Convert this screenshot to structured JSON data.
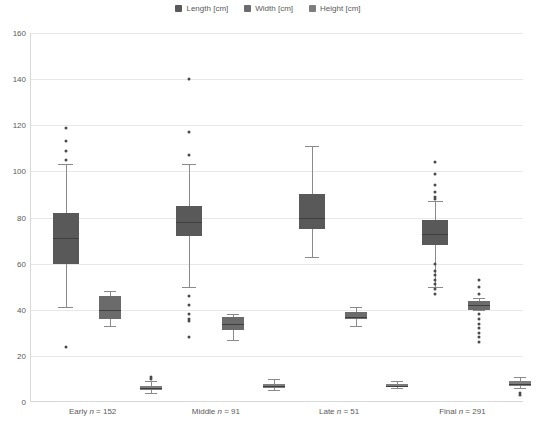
{
  "legend": {
    "position": "top-center",
    "items": [
      {
        "label": "Length [cm]",
        "color": "#595959"
      },
      {
        "label": "Width [cm]",
        "color": "#6b6b6b"
      },
      {
        "label": "Height [cm]",
        "color": "#7d7d7d"
      }
    ]
  },
  "axes": {
    "y": {
      "min": 0,
      "max": 160,
      "step": 20,
      "ticks": [
        "0",
        "20",
        "40",
        "60",
        "80",
        "100",
        "120",
        "140",
        "160"
      ],
      "label": "",
      "grid": true
    },
    "x": {
      "label": "",
      "categories": [
        {
          "name": "Early",
          "n": 152,
          "label": "Early n = 152"
        },
        {
          "name": "Middle",
          "n": 91,
          "label": "Middle n = 91"
        },
        {
          "name": "Late",
          "n": 51,
          "label": "Late n = 51"
        },
        {
          "name": "Final",
          "n": 291,
          "label": "Final n = 291"
        }
      ]
    }
  },
  "chart_data": {
    "type": "box",
    "title": "",
    "xlabel": "",
    "ylabel": "",
    "ylim": [
      0,
      160
    ],
    "grid": true,
    "categories": [
      "Early n = 152",
      "Middle n = 91",
      "Late n = 51",
      "Final n = 291"
    ],
    "series": [
      {
        "name": "Length [cm]",
        "color": "#595959",
        "boxes": [
          {
            "category": "Early n = 152",
            "whisker_low": 41,
            "q1": 60,
            "median": 71,
            "q3": 82,
            "whisker_high": 103,
            "outliers": [
              119,
              113,
              109,
              105,
              24
            ]
          },
          {
            "category": "Middle n = 91",
            "whisker_low": 50,
            "q1": 72,
            "median": 78,
            "q3": 85,
            "whisker_high": 103,
            "outliers": [
              140,
              117,
              107,
              46,
              42,
              38,
              36,
              35,
              28
            ]
          },
          {
            "category": "Late n = 51",
            "whisker_low": 63,
            "q1": 75,
            "median": 80,
            "q3": 90,
            "whisker_high": 111,
            "outliers": []
          },
          {
            "category": "Final n = 291",
            "whisker_low": 50,
            "q1": 68,
            "median": 73,
            "q3": 79,
            "whisker_high": 87,
            "outliers": [
              104,
              99,
              94,
              91,
              89,
              88,
              60,
              57,
              55,
              53,
              51,
              49,
              47
            ]
          }
        ]
      },
      {
        "name": "Width [cm]",
        "color": "#6b6b6b",
        "boxes": [
          {
            "category": "Early n = 152",
            "whisker_low": 33,
            "q1": 36,
            "median": 40,
            "q3": 46,
            "whisker_high": 48,
            "outliers": []
          },
          {
            "category": "Middle n = 91",
            "whisker_low": 27,
            "q1": 31,
            "median": 34,
            "q3": 37,
            "whisker_high": 38,
            "outliers": []
          },
          {
            "category": "Late n = 51",
            "whisker_low": 33,
            "q1": 36,
            "median": 37,
            "q3": 39,
            "whisker_high": 41,
            "outliers": []
          },
          {
            "category": "Final n = 291",
            "whisker_low": 40,
            "q1": 40,
            "median": 42,
            "q3": 44,
            "whisker_high": 45,
            "outliers": [
              53,
              50,
              47,
              38,
              36,
              34,
              32,
              30,
              28,
              26
            ]
          }
        ]
      },
      {
        "name": "Height [cm]",
        "color": "#7d7d7d",
        "boxes": [
          {
            "category": "Early n = 152",
            "whisker_low": 4,
            "q1": 5,
            "median": 6,
            "q3": 7,
            "whisker_high": 9,
            "outliers": [
              11,
              10
            ]
          },
          {
            "category": "Middle n = 91",
            "whisker_low": 5,
            "q1": 6,
            "median": 7,
            "q3": 8,
            "whisker_high": 10,
            "outliers": []
          },
          {
            "category": "Late n = 51",
            "whisker_low": 6,
            "q1": 7,
            "median": 7,
            "q3": 8,
            "whisker_high": 9,
            "outliers": []
          },
          {
            "category": "Final n = 291",
            "whisker_low": 6,
            "q1": 7,
            "median": 8,
            "q3": 9,
            "whisker_high": 11,
            "outliers": [
              4,
              3
            ]
          }
        ]
      }
    ]
  }
}
